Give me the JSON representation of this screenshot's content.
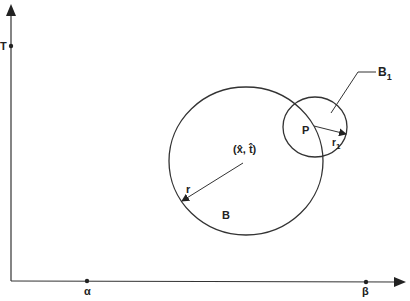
{
  "diagram": {
    "axes": {
      "y_label": "T",
      "x_marks": [
        {
          "label": "α"
        },
        {
          "label": "β"
        }
      ]
    },
    "circle_B": {
      "label": "B",
      "center_label": "(x̂, t̂)",
      "radius_label": "r"
    },
    "circle_B1": {
      "label": "B",
      "label_sub": "1",
      "point_label": "P",
      "radius_label": "r",
      "radius_sub": "1"
    }
  }
}
